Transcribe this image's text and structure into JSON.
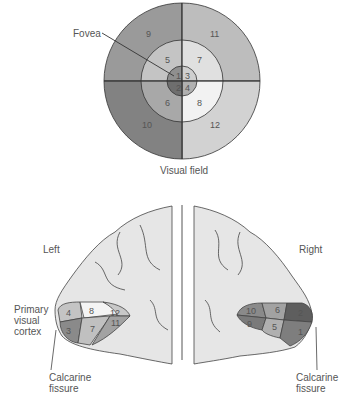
{
  "visual_field": {
    "caption": "Visual field",
    "fovea_label": "Fovea",
    "sectors": [
      {
        "id": "1",
        "ring": "center",
        "quadrant": "upper-left",
        "color": "#8f8f8f"
      },
      {
        "id": "2",
        "ring": "center",
        "quadrant": "lower-left",
        "color": "#6e6e6e"
      },
      {
        "id": "3",
        "ring": "center",
        "quadrant": "upper-right",
        "color": "#cfcfcf"
      },
      {
        "id": "4",
        "ring": "center",
        "quadrant": "lower-right",
        "color": "#b0b0b0"
      },
      {
        "id": "5",
        "ring": "middle",
        "quadrant": "upper-left",
        "color": "#c4c4c4"
      },
      {
        "id": "6",
        "ring": "middle",
        "quadrant": "lower-left",
        "color": "#a8a8a8"
      },
      {
        "id": "7",
        "ring": "middle",
        "quadrant": "upper-right",
        "color": "#e0e0e0"
      },
      {
        "id": "8",
        "ring": "middle",
        "quadrant": "lower-right",
        "color": "#f2f2f2"
      },
      {
        "id": "9",
        "ring": "outer",
        "quadrant": "upper-left",
        "color": "#9a9a9a"
      },
      {
        "id": "10",
        "ring": "outer",
        "quadrant": "lower-left",
        "color": "#828282"
      },
      {
        "id": "11",
        "ring": "outer",
        "quadrant": "upper-right",
        "color": "#bdbdbd"
      },
      {
        "id": "12",
        "ring": "outer",
        "quadrant": "lower-right",
        "color": "#d2d2d2"
      }
    ]
  },
  "brain": {
    "left_label": "Left",
    "right_label": "Right",
    "primary_visual_cortex_label": [
      "Primary",
      "visual",
      "cortex"
    ],
    "calcarine_left": [
      "Calcarine",
      "fissure"
    ],
    "calcarine_right": [
      "Calcarine",
      "fissure"
    ],
    "left_regions": [
      "4",
      "8",
      "12",
      "3",
      "7",
      "11"
    ],
    "right_regions": [
      "10",
      "6",
      "2",
      "9",
      "5",
      "1"
    ]
  }
}
